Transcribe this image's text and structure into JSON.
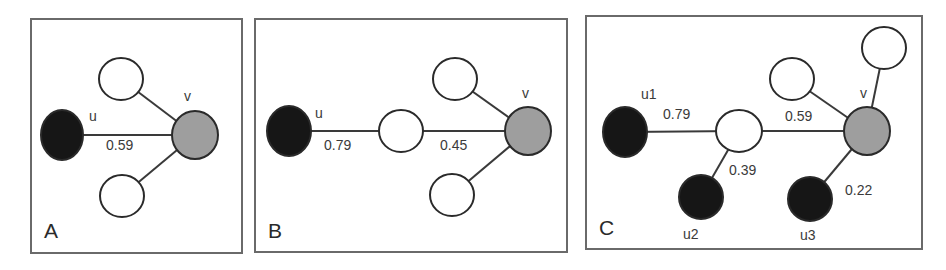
{
  "colors": {
    "source_node": "#161616",
    "target_node": "#9e9e9e",
    "intermediate_node": "#ffffff",
    "edge": "#3a3a3a",
    "frame": "#6a6a6a"
  },
  "panels": [
    {
      "label": "A",
      "frame": {
        "x": 31,
        "y": 19,
        "w": 211,
        "h": 234
      },
      "nodes": [
        {
          "id": "u",
          "kind": "source",
          "cx": 62,
          "cy": 135,
          "rx": 21,
          "ry": 25,
          "label": "u",
          "lx": 89,
          "ly": 121
        },
        {
          "id": "v",
          "kind": "target",
          "cx": 195,
          "cy": 135,
          "rx": 23,
          "ry": 24,
          "label": "v",
          "lx": 184,
          "ly": 101
        },
        {
          "id": "a1",
          "kind": "intermediate",
          "cx": 121,
          "cy": 79,
          "rx": 22,
          "ry": 21,
          "label": ""
        },
        {
          "id": "a2",
          "kind": "intermediate",
          "cx": 122,
          "cy": 196,
          "rx": 22,
          "ry": 21,
          "label": ""
        }
      ],
      "edges": [
        {
          "from": "u",
          "to": "v",
          "weight": "0.59",
          "wx": 106,
          "wy": 150
        },
        {
          "from": "a1",
          "to": "v",
          "weight": ""
        },
        {
          "from": "a2",
          "to": "v",
          "weight": ""
        }
      ]
    },
    {
      "label": "B",
      "frame": {
        "x": 255,
        "y": 19,
        "w": 312,
        "h": 233
      },
      "nodes": [
        {
          "id": "u",
          "kind": "source",
          "cx": 289,
          "cy": 131,
          "rx": 22,
          "ry": 25,
          "label": "u",
          "lx": 315,
          "ly": 118
        },
        {
          "id": "b1",
          "kind": "intermediate",
          "cx": 401,
          "cy": 131,
          "rx": 22,
          "ry": 21,
          "label": ""
        },
        {
          "id": "v",
          "kind": "target",
          "cx": 528,
          "cy": 131,
          "rx": 23,
          "ry": 24,
          "label": "v",
          "lx": 522,
          "ly": 98
        },
        {
          "id": "b2",
          "kind": "intermediate",
          "cx": 455,
          "cy": 79,
          "rx": 22,
          "ry": 21,
          "label": ""
        },
        {
          "id": "b3",
          "kind": "intermediate",
          "cx": 452,
          "cy": 195,
          "rx": 22,
          "ry": 21,
          "label": ""
        }
      ],
      "edges": [
        {
          "from": "u",
          "to": "b1",
          "weight": "0.79",
          "wx": 324,
          "wy": 150
        },
        {
          "from": "b1",
          "to": "v",
          "weight": "0.45",
          "wx": 440,
          "wy": 150
        },
        {
          "from": "b2",
          "to": "v",
          "weight": ""
        },
        {
          "from": "b3",
          "to": "v",
          "weight": ""
        }
      ]
    },
    {
      "label": "C",
      "frame": {
        "x": 586,
        "y": 16,
        "w": 336,
        "h": 233
      },
      "nodes": [
        {
          "id": "u1",
          "kind": "source",
          "cx": 625,
          "cy": 132,
          "rx": 22,
          "ry": 25,
          "label": "u1",
          "lx": 641,
          "ly": 99
        },
        {
          "id": "c1",
          "kind": "intermediate",
          "cx": 739,
          "cy": 131,
          "rx": 23,
          "ry": 21,
          "label": ""
        },
        {
          "id": "u2",
          "kind": "source",
          "cx": 701,
          "cy": 197,
          "rx": 22,
          "ry": 22,
          "label": "u2",
          "lx": 683,
          "ly": 239
        },
        {
          "id": "v",
          "kind": "target",
          "cx": 867,
          "cy": 131,
          "rx": 23,
          "ry": 24,
          "label": "v",
          "lx": 860,
          "ly": 98
        },
        {
          "id": "c2",
          "kind": "intermediate",
          "cx": 792,
          "cy": 79,
          "rx": 22,
          "ry": 21,
          "label": ""
        },
        {
          "id": "c3",
          "kind": "intermediate",
          "cx": 884,
          "cy": 48,
          "rx": 22,
          "ry": 21,
          "label": ""
        },
        {
          "id": "u3",
          "kind": "source",
          "cx": 810,
          "cy": 199,
          "rx": 22,
          "ry": 22,
          "label": "u3",
          "lx": 800,
          "ly": 240
        }
      ],
      "edges": [
        {
          "from": "u1",
          "to": "c1",
          "weight": "0.79",
          "wx": 663,
          "wy": 119
        },
        {
          "from": "c1",
          "to": "v",
          "weight": "0.59",
          "wx": 785,
          "wy": 121
        },
        {
          "from": "c1",
          "to": "u2",
          "weight": "0.39",
          "wx": 729,
          "wy": 175
        },
        {
          "from": "c2",
          "to": "v",
          "weight": ""
        },
        {
          "from": "c3",
          "to": "v",
          "weight": ""
        },
        {
          "from": "u3",
          "to": "v",
          "weight": "0.22",
          "wx": 845,
          "wy": 195
        }
      ]
    }
  ]
}
